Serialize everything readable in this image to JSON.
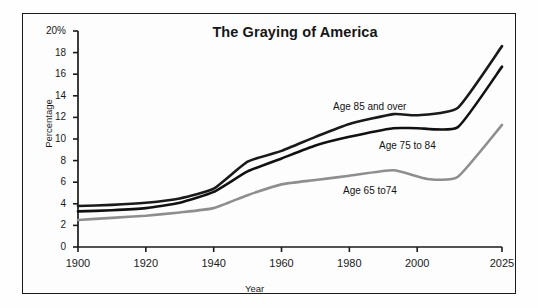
{
  "figure": {
    "title": "The Graying of America",
    "xlabel": "Year",
    "ylabel": "Percentage"
  },
  "axes": {
    "y_ticks": [
      "20%",
      "18",
      "16",
      "14",
      "12",
      "10",
      "8",
      "6",
      "4",
      "2",
      "0"
    ],
    "x_ticks": [
      "1900",
      "1920",
      "1940",
      "1960",
      "1980",
      "2000",
      "2025"
    ]
  },
  "series_labels": {
    "age85": "Age 85 and over",
    "age75": "Age 75 to 84",
    "age65": "Age 65 to74"
  },
  "colors": {
    "dark_line": "#1a1a1a",
    "mid_line": "#111111",
    "grey_line": "#8e8e8e",
    "axis": "#1a1a1a",
    "frame": "#1a1a1a",
    "background": "#fdfdfd"
  },
  "chart_data": {
    "type": "line",
    "title": "The Graying of America",
    "xlabel": "Year",
    "ylabel": "Percentage",
    "xlim": [
      1900,
      2025
    ],
    "ylim": [
      0,
      20
    ],
    "ytick_values": [
      0,
      2,
      4,
      6,
      8,
      10,
      12,
      14,
      16,
      18,
      20
    ],
    "xtick_values": [
      1900,
      1920,
      1940,
      1960,
      1980,
      2000,
      2025
    ],
    "grid": false,
    "legend": "inline-annotations",
    "units": "percent",
    "series": [
      {
        "name": "Age 85 and over",
        "color": "#1a1a1a",
        "x": [
          1900,
          1910,
          1920,
          1930,
          1940,
          1950,
          1960,
          1970,
          1980,
          1993,
          2000,
          2012,
          2025
        ],
        "values": [
          3.8,
          3.9,
          4.1,
          4.5,
          5.4,
          7.9,
          8.9,
          10.2,
          11.4,
          12.3,
          12.2,
          12.9,
          18.6
        ]
      },
      {
        "name": "Age 75 to 84",
        "color": "#111111",
        "x": [
          1900,
          1910,
          1920,
          1930,
          1940,
          1950,
          1960,
          1970,
          1980,
          1993,
          2000,
          2012,
          2025
        ],
        "values": [
          3.3,
          3.4,
          3.6,
          4.1,
          5.1,
          7.0,
          8.2,
          9.4,
          10.2,
          11.0,
          11.0,
          11.1,
          16.7
        ]
      },
      {
        "name": "Age 65 to74",
        "color": "#8e8e8e",
        "x": [
          1900,
          1910,
          1920,
          1930,
          1940,
          1950,
          1960,
          1970,
          1980,
          1993,
          2003,
          2012,
          2025
        ],
        "values": [
          2.5,
          2.7,
          2.9,
          3.2,
          3.6,
          4.8,
          5.8,
          6.2,
          6.6,
          7.1,
          6.3,
          6.5,
          11.3
        ]
      }
    ]
  }
}
